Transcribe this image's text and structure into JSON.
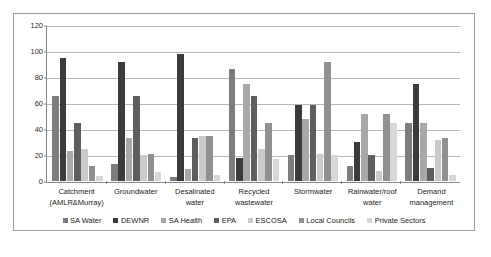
{
  "chart_data": {
    "type": "bar",
    "title": "",
    "subtitle": "",
    "xlabel": "",
    "ylabel": "",
    "ylim": [
      0,
      120
    ],
    "yticks": [
      0,
      20,
      40,
      60,
      80,
      100,
      120
    ],
    "ytick_labels": [
      "0",
      "20",
      "40",
      "60",
      "80",
      "100",
      "120"
    ],
    "grid": true,
    "legend_position": "bottom",
    "categories": [
      "Catchment\n(AMLR&Murray)",
      "Groundwater",
      "Desalinated\nwater",
      "Recycled\nwastewater",
      "Stormwater",
      "Rainwater/roof\nwater",
      "Demand\nmanagement"
    ],
    "series": [
      {
        "name": "SA Water",
        "color": "#7d7d7d",
        "values": [
          66,
          13,
          3,
          87,
          20,
          12,
          45
        ]
      },
      {
        "name": "DEWNR",
        "color": "#3b3b3b",
        "values": [
          95,
          92,
          98,
          18,
          59,
          30,
          75
        ]
      },
      {
        "name": "SA Health",
        "color": "#a8a8a8",
        "values": [
          23,
          33,
          9,
          75,
          48,
          52,
          45
        ]
      },
      {
        "name": "EPA",
        "color": "#5e5e5e",
        "values": [
          45,
          66,
          33,
          66,
          59,
          20,
          10
        ]
      },
      {
        "name": "ESCOSA",
        "color": "#cacaca",
        "values": [
          25,
          20,
          35,
          25,
          21,
          8,
          32
        ]
      },
      {
        "name": "Local Councils",
        "color": "#909090",
        "values": [
          12,
          21,
          35,
          45,
          92,
          52,
          33
        ]
      },
      {
        "name": "Private Sectors",
        "color": "#d8d8d8",
        "values": [
          4,
          7,
          5,
          17,
          20,
          45,
          5
        ]
      }
    ]
  }
}
